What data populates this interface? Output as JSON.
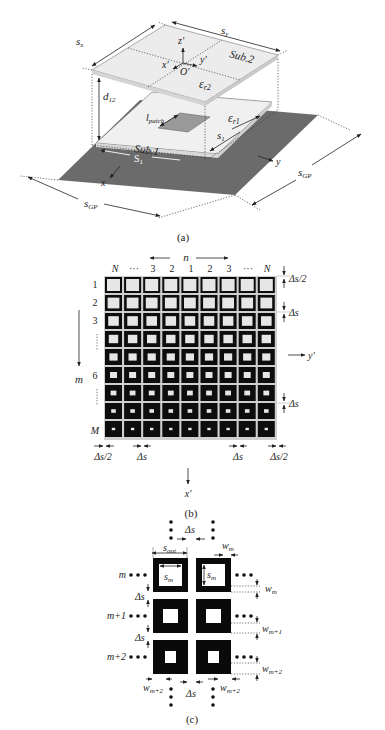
{
  "figure": {
    "panel_a": {
      "caption": "(a)",
      "labels": {
        "sx": "s",
        "sx_sub": "x",
        "sy": "s",
        "sy_sub": "y",
        "z_prime": "z'",
        "x_prime": "x'",
        "y_prime": "y'",
        "origin": "O'",
        "sub2": "Sub.2",
        "er2": "ε",
        "er2_sub": "r2",
        "d12": "d",
        "d12_sub": "12",
        "lpatch": "l",
        "lpatch_sub": "patch",
        "er1": "ε",
        "er1_sub": "r1",
        "s1_right": "s",
        "s1_right_sub": "1",
        "sub1": "Sub.1",
        "s1_bottom": "S",
        "s1_bottom_sub": "1",
        "x": "x",
        "y": "y",
        "sgp_left": "s",
        "sgp_left_sub": "GP",
        "sgp_right": "s",
        "sgp_right_sub": "GP"
      },
      "colors": {
        "ground_plane": "#6b6b6b",
        "substrate": "#f0f0f0",
        "patch": "#9a9a9a"
      }
    },
    "panel_b": {
      "caption": "(b)",
      "n_label": "n",
      "column_labels": [
        "N",
        "···",
        "3",
        "2",
        "1",
        "2",
        "3",
        "···",
        "N"
      ],
      "row_labels": [
        "1",
        "2",
        "3",
        "⋮",
        "",
        "6",
        "⋮",
        "",
        "M"
      ],
      "m_label": "m",
      "y_prime": "y'",
      "x_prime": "x'",
      "right_dims": [
        "Δs/2",
        "Δs",
        "Δs"
      ],
      "bottom_dims": [
        "Δs/2",
        "Δs",
        "Δs",
        "Δs/2"
      ],
      "rows": 9,
      "cols": 9,
      "row_wall_widths": [
        2,
        2.6,
        3.2,
        3.8,
        4.4,
        5,
        5.6,
        6.2,
        6.8
      ]
    },
    "panel_c": {
      "caption": "(c)",
      "row_labels": [
        "m",
        "m+1",
        "m+2"
      ],
      "ellipsis": "•••",
      "top_delta": "Δs",
      "bottom_delta": "Δs",
      "s_out": "s",
      "s_out_sub": "out",
      "w_m_top": "w",
      "w_m_top_sub": "m",
      "s_m_left": "s",
      "s_m_left_sub": "m",
      "s_m_right": "s",
      "s_m_right_sub": "m",
      "delta_left_1": "Δs",
      "delta_left_2": "Δs",
      "w_right": [
        {
          "base": "w",
          "sub": "m"
        },
        {
          "base": "w",
          "sub": "m+1"
        },
        {
          "base": "w",
          "sub": "m+2"
        }
      ],
      "w_bottom_left": "w",
      "w_bottom_left_sub": "m+2",
      "w_bottom_right": "w",
      "w_bottom_right_sub": "m+2"
    }
  }
}
